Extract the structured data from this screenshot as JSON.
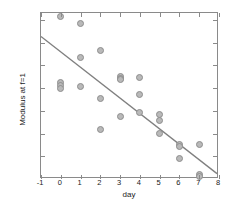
{
  "chart_data": {
    "type": "scatter",
    "title": "",
    "xlabel": "day",
    "ylabel": "Modulus at f=1",
    "xlim": [
      -1,
      8
    ],
    "ylim": [
      0,
      73
    ],
    "xticks": [
      -1,
      0,
      1,
      2,
      3,
      4,
      5,
      6,
      7,
      8
    ],
    "xticklabels": [
      "-1",
      "0",
      "1",
      "2",
      "3",
      "4",
      "5",
      "6",
      "7",
      "8"
    ],
    "yticks": [
      10,
      20,
      30,
      40,
      50,
      60,
      70
    ],
    "yticklabels": [
      "10",
      "20",
      "30",
      "40",
      "50",
      "60",
      "70"
    ],
    "grid": false,
    "legend": null,
    "marker_style": "open-circle-gray",
    "marker_color": "#b9b9b9",
    "marker_edge_color": "#8e8e8e",
    "line_color": "#808080",
    "axis_color": "#8a8a8a",
    "points": [
      {
        "x": 0,
        "y": 71.5
      },
      {
        "x": 0,
        "y": 42.3
      },
      {
        "x": 0,
        "y": 41.0
      },
      {
        "x": 0,
        "y": 40.0
      },
      {
        "x": 1,
        "y": 68.5
      },
      {
        "x": 1,
        "y": 53.5
      },
      {
        "x": 1,
        "y": 40.8
      },
      {
        "x": 2,
        "y": 56.5
      },
      {
        "x": 2,
        "y": 35.2
      },
      {
        "x": 2,
        "y": 21.7
      },
      {
        "x": 3,
        "y": 45.0
      },
      {
        "x": 3,
        "y": 44.3
      },
      {
        "x": 3,
        "y": 43.8
      },
      {
        "x": 3,
        "y": 27.5
      },
      {
        "x": 4,
        "y": 44.8
      },
      {
        "x": 4,
        "y": 37.3
      },
      {
        "x": 4,
        "y": 29.3
      },
      {
        "x": 5,
        "y": 28.5
      },
      {
        "x": 5,
        "y": 25.8
      },
      {
        "x": 5,
        "y": 20.0
      },
      {
        "x": 6,
        "y": 15.0
      },
      {
        "x": 6,
        "y": 14.5
      },
      {
        "x": 6,
        "y": 8.8
      },
      {
        "x": 7,
        "y": 15.3
      },
      {
        "x": 7,
        "y": 2.0
      },
      {
        "x": 7,
        "y": 1.0
      }
    ],
    "fit_line": {
      "x": [
        -1,
        8
      ],
      "y": [
        62.5,
        1.5
      ]
    }
  }
}
